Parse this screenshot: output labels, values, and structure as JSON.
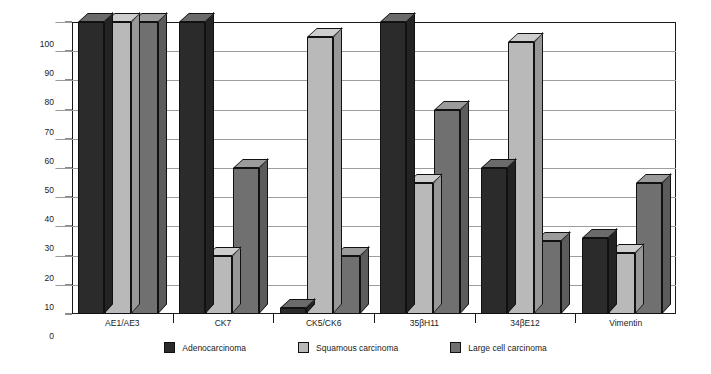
{
  "chart_data": {
    "type": "bar",
    "title": "",
    "xlabel": "",
    "ylabel": "Percent positive",
    "ylim": [
      0,
      100
    ],
    "ytick_step": 10,
    "yticks": [
      100,
      90,
      80,
      70,
      60,
      50,
      40,
      30,
      20,
      10,
      0
    ],
    "grid": true,
    "legend_position": "bottom",
    "categories": [
      "AE1/AE3",
      "CK7",
      "CK5/CK6",
      "35βH11",
      "34βE12",
      "Vimentin"
    ],
    "series": [
      {
        "name": "Adenocarcinoma",
        "color": "#2b2b2b",
        "values": [
          100,
          100,
          2,
          100,
          50,
          26
        ]
      },
      {
        "name": "Squamous carcinoma",
        "color": "#b9b9b9",
        "values": [
          100,
          20,
          95,
          45,
          93,
          21
        ]
      },
      {
        "name": "Large cell carcinoma",
        "color": "#707070",
        "values": [
          100,
          50,
          20,
          70,
          25,
          45
        ]
      }
    ]
  },
  "axis": {
    "y_label": "Percent positive"
  },
  "colors": {
    "axis": "#1a1a1a",
    "grid": "#9d9d9d",
    "background": "#ffffff",
    "bar_top_face": "#c9c9c9",
    "bar_side_face": "#8c8c8c"
  }
}
